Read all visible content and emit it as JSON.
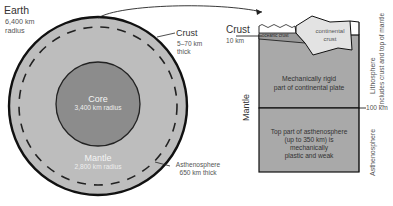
{
  "earth_section": {
    "title": "Earth",
    "radius": "6,400 km",
    "radius_unit": "radius",
    "crust_label": "Crust",
    "crust_thickness": "5–70 km",
    "crust_thickness_unit": "thick",
    "core_label": "Core",
    "core_radius": "3,400 km radius",
    "mantle_label": "Mantle",
    "mantle_radius": "2,800 km radius",
    "asthenosphere_label": "Asthenosphere",
    "asthenosphere_thickness": "650 km thick"
  },
  "detail_section": {
    "crust_label": "Crust",
    "crust_depth": "10 km",
    "oceanic_crust": "oceanic crust",
    "continental_crust_line1": "continental",
    "continental_crust_line2": "crust",
    "rigid_line1": "Mechanically rigid",
    "rigid_line2": "part of continental plate",
    "mantle_label": "Mantle",
    "depth_marker": "100 km",
    "astheno_line1": "Top part of asthenosphere",
    "astheno_line2": "(up to 350 km) is",
    "astheno_line3": "mechanically",
    "astheno_line4": "plastic and weak",
    "lithosphere_label": "Lithosphere",
    "lithosphere_note": "includes crust and top of mantle",
    "asthenosphere_label": "Asthenosphere"
  },
  "colors": {
    "mantle": "#bdbdbd",
    "core": "#8c8c8c",
    "rigid_block": "#a9a9a9",
    "continental_crust": "#e3e3e3",
    "outline": "#111111"
  }
}
